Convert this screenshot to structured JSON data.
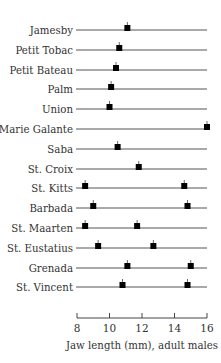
{
  "chart_data": {
    "type": "scatter",
    "subtype": "strip",
    "title": "",
    "xlabel": "Jaw length (mm), adult males",
    "ylabel": "",
    "xlim": [
      8,
      16
    ],
    "xticks": [
      8,
      10,
      12,
      14,
      16
    ],
    "grid": false,
    "legend": null,
    "categories": [
      "Jamesby",
      "Petit Tobac",
      "Petit Bateau",
      "Palm",
      "Union",
      "Marie Galante",
      "Saba",
      "St. Croix",
      "St. Kitts",
      "Barbada",
      "St. Maarten",
      "St. Eustatius",
      "Grenada",
      "St. Vincent"
    ],
    "values": [
      [
        11.1
      ],
      [
        10.6
      ],
      [
        10.4
      ],
      [
        10.1
      ],
      [
        10.0
      ],
      [
        16.0
      ],
      [
        10.5
      ],
      [
        11.8
      ],
      [
        8.5,
        14.6
      ],
      [
        9.0,
        14.8
      ],
      [
        8.5,
        11.7
      ],
      [
        9.3,
        12.7
      ],
      [
        11.1,
        15.0
      ],
      [
        10.8,
        14.8
      ]
    ],
    "marker": "filled-square-with-tick",
    "colors": {
      "marker": "#000000",
      "line": "#555555"
    }
  }
}
